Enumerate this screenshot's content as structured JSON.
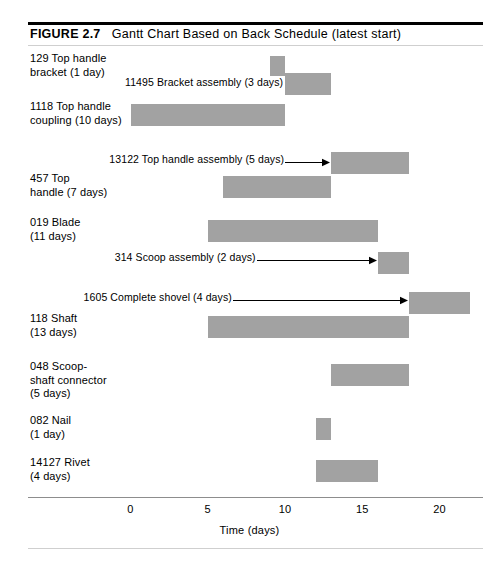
{
  "figure": {
    "label": "FIGURE 2.7",
    "title": "Gantt Chart Based on Back Schedule (latest start)"
  },
  "chart_data": {
    "type": "bar",
    "orientation": "horizontal",
    "title": "Gantt Chart Based on Back Schedule (latest start)",
    "xlabel": "Time (days)",
    "ylabel": "",
    "xlim": [
      0,
      23
    ],
    "xticks": [
      0,
      5,
      10,
      15,
      20
    ],
    "xtick_labels": [
      "0",
      "5",
      "10",
      "15",
      "20"
    ],
    "grid": false,
    "legend": null,
    "bar_color": "#a2a2a2",
    "tasks": [
      {
        "id": "129",
        "name": "Top handle bracket",
        "duration_days": 1,
        "start_day": 9,
        "end_day": 10,
        "side_label": "129 Top handle\nbracket (1 day)",
        "inline_label": null,
        "has_arrow": false
      },
      {
        "id": "11495",
        "name": "Bracket assembly",
        "duration_days": 3,
        "start_day": 10,
        "end_day": 13,
        "side_label": null,
        "inline_label": "11495 Bracket assembly (3 days)",
        "has_arrow": false
      },
      {
        "id": "1118",
        "name": "Top handle coupling",
        "duration_days": 10,
        "start_day": 0,
        "end_day": 10,
        "side_label": "1118 Top handle\ncoupling (10 days)",
        "inline_label": null,
        "has_arrow": false
      },
      {
        "id": "13122",
        "name": "Top handle assembly",
        "duration_days": 5,
        "start_day": 13,
        "end_day": 18,
        "side_label": null,
        "inline_label": "13122 Top handle assembly (5 days)",
        "has_arrow": true
      },
      {
        "id": "457",
        "name": "Top handle",
        "duration_days": 7,
        "start_day": 6,
        "end_day": 13,
        "side_label": "457 Top\nhandle (7 days)",
        "inline_label": null,
        "has_arrow": false
      },
      {
        "id": "019",
        "name": "Blade",
        "duration_days": 11,
        "start_day": 5,
        "end_day": 16,
        "side_label": "019 Blade\n(11 days)",
        "inline_label": null,
        "has_arrow": false
      },
      {
        "id": "314",
        "name": "Scoop assembly",
        "duration_days": 2,
        "start_day": 16,
        "end_day": 18,
        "side_label": null,
        "inline_label": "314 Scoop assembly (2 days)",
        "has_arrow": true
      },
      {
        "id": "1605",
        "name": "Complete shovel",
        "duration_days": 4,
        "start_day": 18,
        "end_day": 22,
        "side_label": null,
        "inline_label": "1605 Complete shovel (4 days)",
        "has_arrow": true
      },
      {
        "id": "118",
        "name": "Shaft",
        "duration_days": 13,
        "start_day": 5,
        "end_day": 18,
        "side_label": "118 Shaft\n(13 days)",
        "inline_label": null,
        "has_arrow": false
      },
      {
        "id": "048",
        "name": "Scoop-shaft connector",
        "duration_days": 5,
        "start_day": 13,
        "end_day": 18,
        "side_label": "048 Scoop-\nshaft connector\n(5 days)",
        "inline_label": null,
        "has_arrow": false
      },
      {
        "id": "082",
        "name": "Nail",
        "duration_days": 1,
        "start_day": 12,
        "end_day": 13,
        "side_label": "082 Nail\n(1 day)",
        "inline_label": null,
        "has_arrow": false
      },
      {
        "id": "14127",
        "name": "Rivet",
        "duration_days": 4,
        "start_day": 12,
        "end_day": 16,
        "side_label": "14127 Rivet\n(4 days)",
        "inline_label": null,
        "has_arrow": false
      }
    ]
  },
  "axis": {
    "title": "Time (days)",
    "ticks": [
      "0",
      "5",
      "10",
      "15",
      "20"
    ]
  }
}
